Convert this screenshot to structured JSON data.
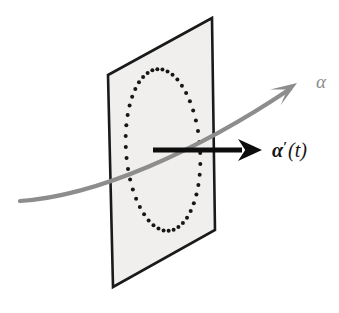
{
  "figure": {
    "kind": "geometry-diagram",
    "title_visible": "",
    "background_color": "#ffffff",
    "plane": {
      "name": "tangent-plane",
      "fill_color": "#f0efed",
      "stroke_color": "#1a1a1a",
      "stroke_width": 2.6,
      "corners": [
        {
          "x": 108,
          "y": 75
        },
        {
          "x": 212,
          "y": 18
        },
        {
          "x": 215,
          "y": 230
        },
        {
          "x": 113,
          "y": 287
        }
      ]
    },
    "dotted_ellipse": {
      "name": "dotted-ellipse",
      "dot_color": "#161616",
      "dot_radius": 2.0,
      "dot_count": 46,
      "center_x": 163,
      "center_y": 150,
      "radius_x": 37,
      "radius_y": 81,
      "rotation_deg": -4
    },
    "curve": {
      "name": "alpha-curve",
      "color": "#8d8d8d",
      "stroke_width": 4.2,
      "start": {
        "x": 20,
        "y": 201
      },
      "control_1": {
        "x": 96,
        "y": 196
      },
      "control_2": {
        "x": 196,
        "y": 152
      },
      "end": {
        "x": 290,
        "y": 89
      },
      "arrow_tip": {
        "x": 297,
        "y": 83
      }
    },
    "velocity_arrow": {
      "name": "velocity-arrow",
      "color": "#0d0d0d",
      "stroke_width": 5.0,
      "start": {
        "x": 153,
        "y": 150
      },
      "end": {
        "x": 262,
        "y": 150
      },
      "head_length": 24,
      "head_half_width": 11
    },
    "labels": [
      {
        "id": "alpha",
        "name": "alpha-label",
        "text": "α",
        "x": 316,
        "y": 88,
        "font_size": 19,
        "color": "#8d8d8d",
        "style": "italic",
        "weight": "normal"
      },
      {
        "id": "alpha_prime_t",
        "name": "alpha-prime-t-label",
        "text": "α′(t)",
        "alpha_part": "α",
        "prime_part": "′",
        "arg_part": "(t)",
        "x": 272,
        "y": 157,
        "font_size": 20,
        "color": "#151515",
        "style": "italic",
        "weight": "bold"
      }
    ]
  }
}
